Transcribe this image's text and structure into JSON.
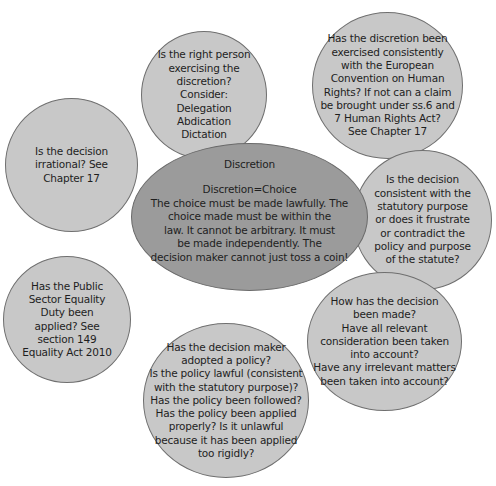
{
  "diagram": {
    "type": "mind-map",
    "center": {
      "title": "Discretion",
      "body": "Discretion=Choice\nThe choice must be made lawfully. The\nchoice made must be within the\nlaw. It cannot be arbitrary. It must\nbe made independently. The\ndecision maker cannot just toss a coin!"
    },
    "nodes": [
      {
        "id": "right-person",
        "text": "Is the right person\nexercising the\ndiscretion?\nConsider:\nDelegation\nAbdication\nDictation"
      },
      {
        "id": "echr",
        "text": "Has the discretion been\nexercised consistently\nwith the European\nConvention on Human\nRights? If not can a claim\nbe brought under ss.6 and\n7 Human Rights Act?\nSee Chapter 17"
      },
      {
        "id": "irrational",
        "text": "Is the decision\nirrational? See\nChapter 17"
      },
      {
        "id": "statutory-purpose",
        "text": "Is the decision\nconsistent with the\nstatutory purpose\nor does it frustrate\nor contradict the\npolicy and purpose\nof the statute?"
      },
      {
        "id": "psed",
        "text": "Has the Public\nSector Equality\nDuty been\napplied? See\nsection 149\nEquality Act  2010"
      },
      {
        "id": "how-made",
        "text": "How has the decision\nbeen made?\nHave all relevant\nconsideration been taken\ninto account?\nHave any irrelevant matters\nbeen taken into account?"
      },
      {
        "id": "policy",
        "text": "Has the decision maker\nadopted a policy?\nIs the policy lawful (consistent\nwith the statutory purpose)?\nHas the policy been followed?\nHas the policy been applied\nproperly? Is it unlawful\nbecause it has been applied\ntoo rigidly?"
      }
    ],
    "colors": {
      "node_fill": "#c8c8c8",
      "center_fill": "#9b9b9b",
      "outline": "#6f6f6f",
      "background": "#ffffff"
    }
  }
}
